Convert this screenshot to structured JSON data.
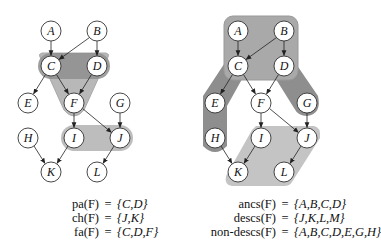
{
  "figure": {
    "left_panel": {
      "nodes": [
        {
          "id": "A",
          "x": 51,
          "y": 31
        },
        {
          "id": "B",
          "x": 97,
          "y": 31
        },
        {
          "id": "C",
          "x": 51,
          "y": 66
        },
        {
          "id": "D",
          "x": 97,
          "y": 66
        },
        {
          "id": "E",
          "x": 28,
          "y": 103
        },
        {
          "id": "F",
          "x": 74,
          "y": 103
        },
        {
          "id": "G",
          "x": 120,
          "y": 103
        },
        {
          "id": "H",
          "x": 28,
          "y": 138
        },
        {
          "id": "I",
          "x": 74,
          "y": 138
        },
        {
          "id": "J",
          "x": 120,
          "y": 138
        },
        {
          "id": "K",
          "x": 51,
          "y": 172
        },
        {
          "id": "L",
          "x": 97,
          "y": 172
        }
      ],
      "highlights": [
        {
          "label": "family",
          "color": "#b8b8b8"
        },
        {
          "label": "parents",
          "color": "#8e8e8e"
        },
        {
          "label": "children",
          "color": "#bdbdbd"
        }
      ],
      "formulas": [
        {
          "lhs": "pa(F)",
          "eq": "=",
          "rhs": "{C,D}"
        },
        {
          "lhs": "ch(F)",
          "eq": "=",
          "rhs": "{J,K}"
        },
        {
          "lhs": "fa(F)",
          "eq": "=",
          "rhs": "{C,D,F}"
        }
      ]
    },
    "right_panel": {
      "nodes": [
        {
          "id": "A",
          "x": 238,
          "y": 31
        },
        {
          "id": "B",
          "x": 284,
          "y": 31
        },
        {
          "id": "C",
          "x": 238,
          "y": 66
        },
        {
          "id": "D",
          "x": 284,
          "y": 66
        },
        {
          "id": "E",
          "x": 215,
          "y": 103
        },
        {
          "id": "F",
          "x": 261,
          "y": 103
        },
        {
          "id": "G",
          "x": 307,
          "y": 103
        },
        {
          "id": "H",
          "x": 215,
          "y": 138
        },
        {
          "id": "I",
          "x": 261,
          "y": 138
        },
        {
          "id": "J",
          "x": 307,
          "y": 138
        },
        {
          "id": "K",
          "x": 238,
          "y": 172
        },
        {
          "id": "L",
          "x": 284,
          "y": 172
        }
      ],
      "highlights": [
        {
          "label": "ancestors",
          "color": "#a9a9a9"
        },
        {
          "label": "non-descendants",
          "color": "#8e8e8e"
        },
        {
          "label": "descendants",
          "color": "#c4c4c4"
        }
      ],
      "formulas": [
        {
          "lhs": "ancs(F)",
          "eq": "=",
          "rhs": "{A,B,C,D}"
        },
        {
          "lhs": "descs(F)",
          "eq": "=",
          "rhs": "{J,K,L,M}"
        },
        {
          "lhs": "non-descs(F)",
          "eq": "=",
          "rhs": "{A,B,C,D,E,G,H}"
        }
      ]
    },
    "edges": [
      [
        "A",
        "C"
      ],
      [
        "B",
        "C"
      ],
      [
        "B",
        "D"
      ],
      [
        "C",
        "E"
      ],
      [
        "C",
        "F"
      ],
      [
        "D",
        "F"
      ],
      [
        "F",
        "I"
      ],
      [
        "F",
        "J"
      ],
      [
        "G",
        "J"
      ],
      [
        "H",
        "K"
      ],
      [
        "I",
        "K"
      ],
      [
        "J",
        "L"
      ]
    ]
  }
}
